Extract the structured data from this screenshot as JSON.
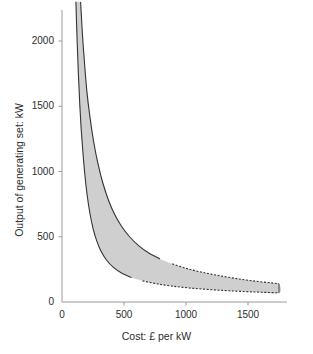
{
  "chart_data": {
    "type": "area",
    "title": "",
    "subtitle": "",
    "xlabel": "Cost: £ per kW",
    "ylabel": "Output of generating set: kW",
    "xlim": [
      0,
      1800
    ],
    "ylim": [
      0,
      2300
    ],
    "xticks": [
      0,
      500,
      1000,
      1500
    ],
    "yticks": [
      0,
      500,
      1000,
      1500,
      2000
    ],
    "xtick_labels": [
      "0",
      "500",
      "1000",
      "1500"
    ],
    "ytick_labels": [
      "0",
      "500",
      "1000",
      "1500",
      "2000"
    ],
    "grid": false,
    "legend": null,
    "legend_position": "none",
    "band_fill_color": "#cfcfcf",
    "band_edge_color": "#333333",
    "axis_color": "#9a9a9a",
    "series": [
      {
        "name": "upper-boundary",
        "role": "band_upper",
        "line_style_solid_until_x": 830,
        "line_style_after": "dashed",
        "points": [
          {
            "x": 150,
            "y": 2300
          },
          {
            "x": 165,
            "y": 2050
          },
          {
            "x": 180,
            "y": 1850
          },
          {
            "x": 200,
            "y": 1620
          },
          {
            "x": 225,
            "y": 1420
          },
          {
            "x": 255,
            "y": 1230
          },
          {
            "x": 290,
            "y": 1060
          },
          {
            "x": 330,
            "y": 910
          },
          {
            "x": 375,
            "y": 780
          },
          {
            "x": 425,
            "y": 670
          },
          {
            "x": 480,
            "y": 580
          },
          {
            "x": 545,
            "y": 500
          },
          {
            "x": 620,
            "y": 430
          },
          {
            "x": 700,
            "y": 375
          },
          {
            "x": 790,
            "y": 330
          },
          {
            "x": 890,
            "y": 292
          },
          {
            "x": 1000,
            "y": 258
          },
          {
            "x": 1120,
            "y": 230
          },
          {
            "x": 1250,
            "y": 205
          },
          {
            "x": 1390,
            "y": 182
          },
          {
            "x": 1540,
            "y": 162
          },
          {
            "x": 1700,
            "y": 145
          },
          {
            "x": 1750,
            "y": 140
          }
        ]
      },
      {
        "name": "lower-boundary",
        "role": "band_lower",
        "line_style_solid_until_x": 590,
        "line_style_after": "dashed",
        "points": [
          {
            "x": 112,
            "y": 2300
          },
          {
            "x": 122,
            "y": 2000
          },
          {
            "x": 132,
            "y": 1750
          },
          {
            "x": 143,
            "y": 1520
          },
          {
            "x": 155,
            "y": 1320
          },
          {
            "x": 170,
            "y": 1130
          },
          {
            "x": 186,
            "y": 960
          },
          {
            "x": 204,
            "y": 810
          },
          {
            "x": 225,
            "y": 680
          },
          {
            "x": 250,
            "y": 565
          },
          {
            "x": 280,
            "y": 468
          },
          {
            "x": 315,
            "y": 388
          },
          {
            "x": 360,
            "y": 320
          },
          {
            "x": 415,
            "y": 265
          },
          {
            "x": 480,
            "y": 222
          },
          {
            "x": 560,
            "y": 188
          },
          {
            "x": 650,
            "y": 162
          },
          {
            "x": 760,
            "y": 140
          },
          {
            "x": 880,
            "y": 123
          },
          {
            "x": 1020,
            "y": 108
          },
          {
            "x": 1180,
            "y": 96
          },
          {
            "x": 1350,
            "y": 86
          },
          {
            "x": 1550,
            "y": 77
          },
          {
            "x": 1750,
            "y": 70
          }
        ]
      }
    ]
  }
}
